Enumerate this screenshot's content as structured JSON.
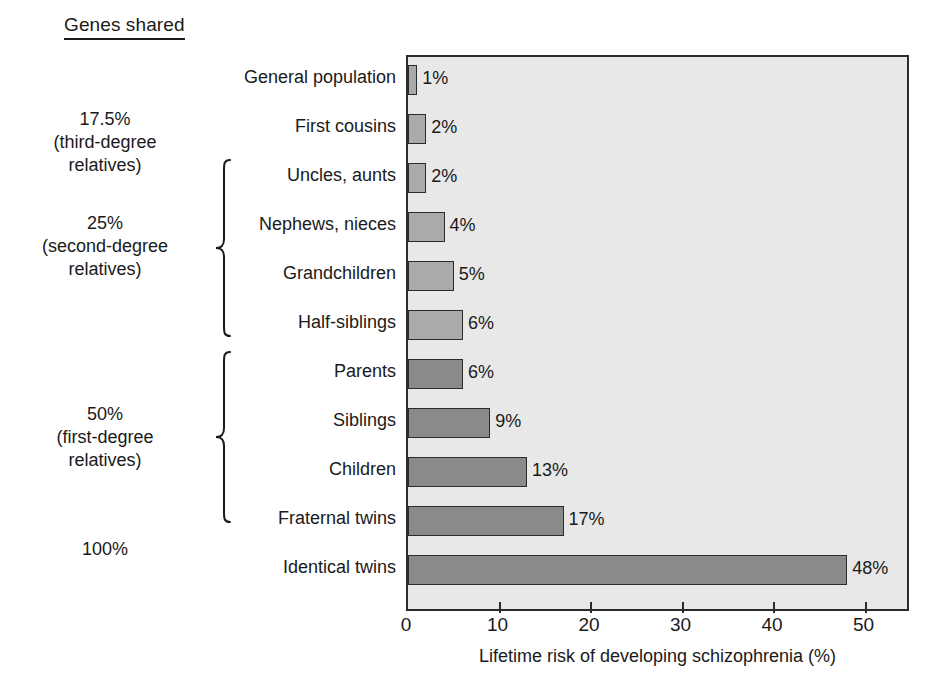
{
  "title": "Genes shared",
  "genes_groups": [
    {
      "id": "g-17-5",
      "text": "17.5%\n(third-degree\nrelatives)",
      "top": 108
    },
    {
      "id": "g-25",
      "text": "25%\n(second-degree\nrelatives)",
      "top": 212
    },
    {
      "id": "g-50",
      "text": "50%\n(first-degree\nrelatives)",
      "top": 403
    },
    {
      "id": "g-100",
      "text": "100%",
      "top": 538
    }
  ],
  "braces": [
    {
      "id": "brace-second-degree",
      "top": 158,
      "height": 180
    },
    {
      "id": "brace-first-degree",
      "top": 350,
      "height": 174
    }
  ],
  "chart_data": {
    "type": "bar",
    "orientation": "horizontal",
    "title": "",
    "xlabel": "Lifetime risk of developing schizophrenia (%)",
    "ylabel": "",
    "xlim": [
      0,
      54.6
    ],
    "xticks": [
      0,
      10,
      20,
      30,
      40,
      50
    ],
    "xtick_labels": [
      "0",
      "10",
      "20",
      "30",
      "40",
      "50"
    ],
    "grid": false,
    "legend": "none",
    "plot_background": "#e8e8e8",
    "colors": {
      "light_bar": "#aaaaaa",
      "dark_bar": "#8a8a8a",
      "frame": "#2b2b2b"
    },
    "categories": [
      "General population",
      "First cousins",
      "Uncles, aunts",
      "Nephews, nieces",
      "Grandchildren",
      "Half-siblings",
      "Parents",
      "Siblings",
      "Children",
      "Fraternal twins",
      "Identical twins"
    ],
    "values": [
      1,
      2,
      2,
      4,
      5,
      6,
      6,
      9,
      13,
      17,
      48
    ],
    "value_labels": [
      "1%",
      "2%",
      "2%",
      "4%",
      "5%",
      "6%",
      "6%",
      "9%",
      "13%",
      "17%",
      "48%"
    ],
    "shades": [
      "light",
      "light",
      "light",
      "light",
      "light",
      "light",
      "dark",
      "dark",
      "dark",
      "dark",
      "dark"
    ],
    "genes_shared": [
      "",
      "17.5% (third-degree relatives)",
      "25% (second-degree relatives)",
      "25% (second-degree relatives)",
      "25% (second-degree relatives)",
      "25% (second-degree relatives)",
      "50% (first-degree relatives)",
      "50% (first-degree relatives)",
      "50% (first-degree relatives)",
      "50% (first-degree relatives)",
      "100%"
    ]
  },
  "layout": {
    "plot_left": 406,
    "plot_top": 55,
    "plot_width": 503,
    "plot_height": 556,
    "px_per_unit": 9.15,
    "row_height": 49,
    "first_row_top": 8,
    "bar_height": 30
  }
}
